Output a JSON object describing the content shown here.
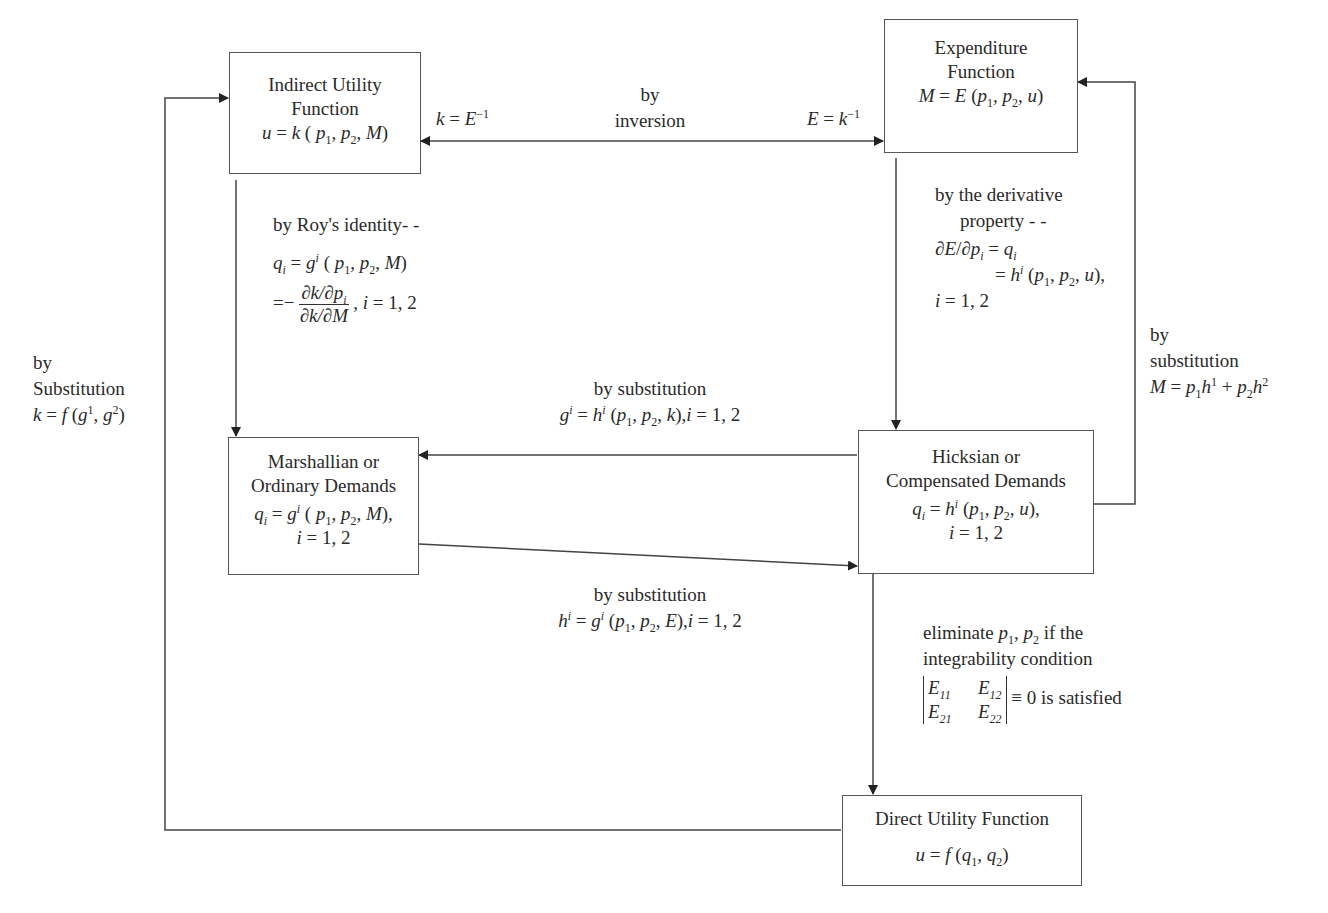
{
  "diagram": {
    "type": "flowchart",
    "nodes": {
      "indirect_utility": {
        "title_line1": "Indirect Utility",
        "title_line2": "Function",
        "formula": "u = k (p1, p2, M)"
      },
      "expenditure": {
        "title_line1": "Expenditure",
        "title_line2": "Function",
        "formula": "M = E (p1, p2, u)"
      },
      "marshallian": {
        "title_line1": "Marshallian or",
        "title_line2": "Ordinary Demands",
        "formula": "qi = g^i (p1, p2, M),",
        "index": "i = 1, 2"
      },
      "hicksian": {
        "title_line1": "Hicksian or",
        "title_line2": "Compensated Demands",
        "formula": "qi = h^i (p1, p2, u),",
        "index": "i = 1, 2"
      },
      "direct_utility": {
        "title": "Direct Utility Function",
        "formula": "u = f (q1, q2)"
      }
    },
    "edges": {
      "inversion": {
        "label_line1": "by",
        "label_line2": "inversion",
        "left": "k = E^-1",
        "right": "E = k^-1"
      },
      "roys_identity": {
        "label": "by Roy's identity- -",
        "line2": "qi = g^i (p1, p2, M)",
        "fraction_prefix": "=−",
        "fraction_num": "∂k/∂pi",
        "fraction_den": "∂k/∂M",
        "suffix": ", i = 1, 2"
      },
      "derivative_property": {
        "label_line1": "by the derivative",
        "label_line2": "property - -",
        "line3": "∂E/∂pi = qi",
        "line4": "= h^i (p1, p2, u),",
        "line5": "i = 1, 2"
      },
      "hicks_to_marshall": {
        "label": "by substitution",
        "formula": "g^i = h^i (p1, p2, k),i = 1, 2"
      },
      "marshall_to_hicks": {
        "label": "by substitution",
        "formula": "h^i = g^i (p1, p2, E),i = 1, 2"
      },
      "hicks_to_expenditure": {
        "label_line1": "by",
        "label_line2": "substitution",
        "formula": "M = p1h^1 + p2h^2"
      },
      "direct_to_indirect": {
        "label_line1": "by",
        "label_line2": "Substitution",
        "formula": "k = f (g^1, g^2)"
      },
      "hicks_to_direct": {
        "label_line1": "eliminate p1, p2 if the",
        "label_line2": "integrability condition",
        "det_E11": "E11",
        "det_E12": "E12",
        "det_E21": "E21",
        "det_E22": "E22",
        "condition": "≡ 0 is satisfied"
      }
    }
  },
  "text": {
    "u": "u",
    "k": "k",
    "M": "M",
    "E": "E",
    "eq": " = ",
    "p": "p",
    "q": "q",
    "g": "g",
    "h": "h",
    "f": "f",
    "i": "i"
  }
}
